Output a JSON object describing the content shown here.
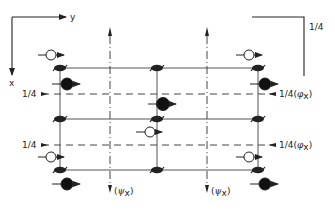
{
  "diagram": {
    "type": "symmetry-element-diagram",
    "colors": {
      "ink": "#222222",
      "grid": "#555555",
      "background": "#ffffff"
    },
    "axes": {
      "y_label": "y",
      "x_label": "x"
    },
    "corner_label": "1/4",
    "left_labels": [
      "1/4",
      "1/4"
    ],
    "right_labels": [
      "1/4 (φx)",
      "1/4 (φx)"
    ],
    "right_label_parts": {
      "frac": "1/4",
      "open": "(",
      "sym": "φ",
      "sub": "x",
      "close": ")"
    },
    "bottom_labels": [
      "(ψx)",
      "(ψx)"
    ],
    "bottom_label_parts": {
      "open": "(",
      "sym": "ψ",
      "sub": "x",
      "close": ")"
    },
    "legend": {
      "open_circle": "atom at +z (open circle with arrow)",
      "filled_circle": "atom at -z (filled circle with arrow)",
      "screw_symbol": "2-fold screw axis symbol",
      "dashed_line": "glide plane at 1/4",
      "dash_dot_line": "glide plane"
    }
  }
}
